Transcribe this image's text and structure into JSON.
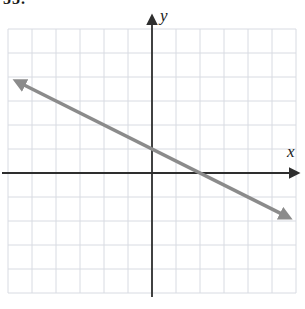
{
  "page": {
    "problem_number": "55."
  },
  "colors": {
    "background": "#ffffff",
    "axis": "#2e2e2e",
    "grid": "#d8dbe2",
    "line": "#8b8b8b",
    "text": "#1a1a1a"
  },
  "chart_data": {
    "type": "line",
    "title": "",
    "xlabel": "x",
    "ylabel": "y",
    "xlim": [
      -6,
      6
    ],
    "ylim": [
      -5,
      6
    ],
    "grid": true,
    "grid_unit": 1,
    "legend": "none",
    "series": [
      {
        "name": "plotted-line",
        "equation": "y = -(1/2)x + 1",
        "slope": -0.5,
        "y_intercept": 1,
        "x_intercept": 2,
        "segment_from": [
          -5.6,
          3.8
        ],
        "segment_to": [
          5.65,
          -1.83
        ],
        "arrowheads": "both",
        "points": [
          [
            -4,
            3
          ],
          [
            -2,
            2
          ],
          [
            0,
            1
          ],
          [
            2,
            0
          ],
          [
            4,
            -1
          ]
        ]
      }
    ]
  }
}
